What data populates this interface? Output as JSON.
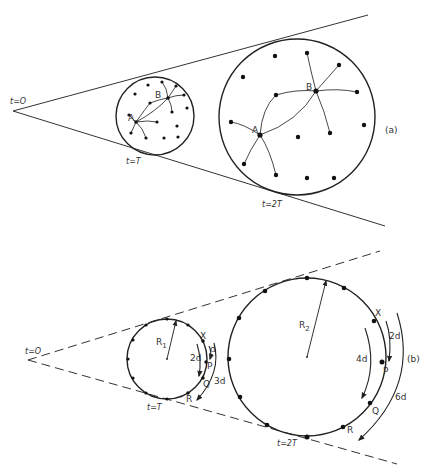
{
  "panel_a": {
    "label": "(a)",
    "apex_label": "t=O",
    "small_circle_label": "t=T",
    "large_circle_label": "t=2T",
    "point_a": "A",
    "point_b": "B"
  },
  "panel_b": {
    "label": "(b)",
    "apex_label": "t=O",
    "small_circle_label": "t=T",
    "large_circle_label": "t=2T",
    "radius_small": "R",
    "radius_small_sub": "1",
    "radius_large": "R",
    "radius_large_sub": "2",
    "small": {
      "x": "X",
      "p": "P",
      "q": "Q",
      "r": "R",
      "d1": "d",
      "d2": "2d",
      "d3": "3d"
    },
    "large": {
      "x": "X",
      "p": "P",
      "q": "Q",
      "r": "R",
      "d1": "2d",
      "d2": "4d",
      "d3": "6d"
    }
  }
}
